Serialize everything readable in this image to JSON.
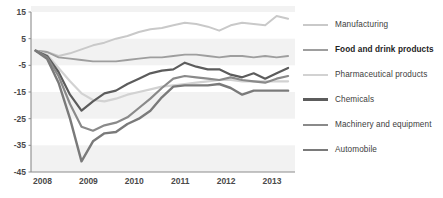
{
  "chart_data": {
    "type": "line",
    "title": "",
    "xlabel": "",
    "ylabel": "",
    "xlim": [
      2007.75,
      2013.5
    ],
    "ylim": [
      -45,
      15
    ],
    "yticks": [
      15,
      5,
      -5,
      -15,
      -25,
      -35,
      -45
    ],
    "xticks": [
      2008,
      2009,
      2010,
      2011,
      2012,
      2013
    ],
    "xtick_labels": [
      "2008",
      "2009",
      "2010",
      "2011",
      "2012",
      "2013"
    ],
    "ytick_labels": [
      "15",
      "5",
      "-5",
      "-15",
      "-25",
      "-35",
      "-45"
    ],
    "grid": false,
    "banded_background": true,
    "band_color": "#f2f2f2",
    "legend_position": "right",
    "x": [
      2007.85,
      2008.1,
      2008.35,
      2008.6,
      2008.85,
      2009.1,
      2009.35,
      2009.6,
      2009.85,
      2010.1,
      2010.35,
      2010.6,
      2010.85,
      2011.1,
      2011.35,
      2011.6,
      2011.85,
      2012.1,
      2012.35,
      2012.6,
      2012.85,
      2013.1,
      2013.35
    ],
    "series": [
      {
        "name": "Manufacturing",
        "color": "#c9c9c9",
        "width": 2.0,
        "values": [
          0.5,
          0.0,
          -1.5,
          -0.5,
          1.0,
          2.5,
          3.5,
          5.0,
          6.0,
          7.5,
          8.5,
          9.0,
          10.0,
          11.0,
          10.5,
          9.5,
          8.0,
          10.0,
          11.0,
          10.5,
          10.0,
          13.5,
          12.5
        ]
      },
      {
        "name": "Food and drink products",
        "color": "#9e9e9e",
        "width": 1.8,
        "values": [
          0.5,
          0.0,
          -2.0,
          -2.5,
          -3.0,
          -3.5,
          -3.5,
          -3.5,
          -3.0,
          -2.5,
          -2.0,
          -2.0,
          -1.5,
          -1.0,
          -1.0,
          -1.5,
          -2.0,
          -1.5,
          -1.5,
          -2.0,
          -1.5,
          -2.0,
          -1.5
        ]
      },
      {
        "name": "Pharmaceutical products",
        "color": "#d2d2d2",
        "width": 2.2,
        "values": [
          0.5,
          -1.0,
          -6.0,
          -11.0,
          -15.5,
          -18.0,
          -18.5,
          -17.5,
          -16.0,
          -15.0,
          -14.0,
          -13.0,
          -12.5,
          -12.0,
          -11.5,
          -11.0,
          -10.5,
          -10.5,
          -11.0,
          -11.0,
          -11.0,
          -11.0,
          -11.0
        ]
      },
      {
        "name": "Chemicals",
        "color": "#5c5c5c",
        "width": 2.2,
        "values": [
          0.5,
          -1.5,
          -7.5,
          -16.0,
          -22.0,
          -18.5,
          -15.5,
          -14.5,
          -12.0,
          -10.0,
          -8.0,
          -7.0,
          -6.5,
          -4.0,
          -5.5,
          -6.5,
          -6.5,
          -8.5,
          -9.5,
          -8.0,
          -10.0,
          -8.0,
          -6.0
        ]
      },
      {
        "name": "Machinery and equipment",
        "color": "#8a8a8a",
        "width": 2.2,
        "values": [
          0.5,
          -2.0,
          -9.0,
          -19.5,
          -28.0,
          -29.5,
          -27.5,
          -26.5,
          -24.5,
          -21.0,
          -17.5,
          -13.5,
          -10.0,
          -9.0,
          -9.5,
          -10.0,
          -10.5,
          -9.5,
          -10.5,
          -11.0,
          -11.5,
          -10.0,
          -9.0
        ]
      },
      {
        "name": "Automobile",
        "color": "#7a7a7a",
        "width": 2.4,
        "values": [
          0.5,
          -2.5,
          -11.5,
          -25.0,
          -41.0,
          -33.5,
          -30.5,
          -30.0,
          -27.0,
          -25.0,
          -22.0,
          -17.0,
          -13.0,
          -12.5,
          -12.5,
          -12.5,
          -12.0,
          -13.5,
          -16.0,
          -14.5,
          -14.5,
          -14.5,
          -14.5
        ]
      }
    ]
  },
  "legend": {
    "items": [
      {
        "label": "Manufacturing",
        "color": "#c9c9c9",
        "width": 2.0,
        "bold": false
      },
      {
        "label": "Food and drink products",
        "color": "#9e9e9e",
        "width": 2.6,
        "bold": true
      },
      {
        "label": "Pharmaceutical products",
        "color": "#d2d2d2",
        "width": 2.4,
        "bold": false
      },
      {
        "label": "Chemicals",
        "color": "#5c5c5c",
        "width": 3.0,
        "bold": false
      },
      {
        "label": "Machinery and equipment",
        "color": "#8a8a8a",
        "width": 2.4,
        "bold": false
      },
      {
        "label": "Automobile",
        "color": "#7a7a7a",
        "width": 2.8,
        "bold": false
      }
    ]
  },
  "axis": {
    "line_color": "#8c8c8c",
    "label_color": "#4a4a4a"
  }
}
